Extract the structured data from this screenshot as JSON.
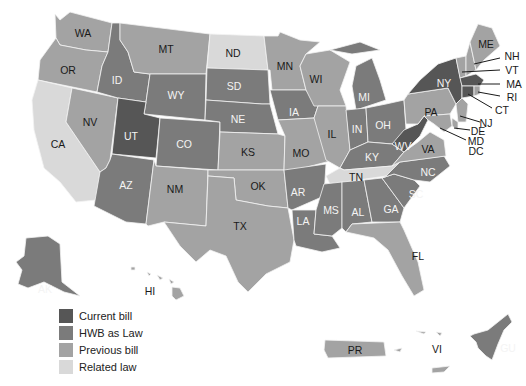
{
  "legend": {
    "items": [
      {
        "label": "Current bill",
        "color": "#565656"
      },
      {
        "label": "HWB as Law",
        "color": "#7b7b7b"
      },
      {
        "label": "Previous bill",
        "color": "#a3a3a3"
      },
      {
        "label": "Related law",
        "color": "#d9d9d9"
      }
    ]
  },
  "states": {
    "WA": "Previous bill",
    "OR": "Previous bill",
    "CA": "Related law",
    "NV": "Previous bill",
    "ID": "HWB as Law",
    "MT": "Previous bill",
    "WY": "HWB as Law",
    "UT": "Current bill",
    "AZ": "HWB as Law",
    "CO": "HWB as Law",
    "NM": "Previous bill",
    "ND": "Related law",
    "SD": "HWB as Law",
    "NE": "HWB as Law",
    "KS": "Previous bill",
    "OK": "Previous bill",
    "TX": "Previous bill",
    "MN": "Previous bill",
    "IA": "HWB as Law",
    "MO": "Previous bill",
    "AR": "HWB as Law",
    "LA": "HWB as Law",
    "WI": "Previous bill",
    "IL": "Previous bill",
    "MI": "HWB as Law",
    "IN": "HWB as Law",
    "OH": "HWB as Law",
    "KY": "HWB as Law",
    "TN": "Related law",
    "MS": "HWB as Law",
    "AL": "HWB as Law",
    "GA": "HWB as Law",
    "FL": "Previous bill",
    "SC": "HWB as Law",
    "NC": "HWB as Law",
    "VA": "Previous bill",
    "WV": "Current bill",
    "PA": "Previous bill",
    "NY": "Current bill",
    "ME": "Previous bill",
    "NH": "Previous bill",
    "VT": "Previous bill",
    "MA": "Current bill",
    "RI": "Previous bill",
    "CT": "Current bill",
    "NJ": "Previous bill",
    "DE": "Previous bill",
    "MD": "Previous bill",
    "DC": "Previous bill",
    "AK": "HWB as Law",
    "HI": "Previous bill",
    "PR": "Previous bill",
    "VI": "Previous bill",
    "GU": "HWB as Law"
  },
  "labels": {
    "WA": "WA",
    "OR": "OR",
    "CA": "CA",
    "NV": "NV",
    "ID": "ID",
    "MT": "MT",
    "WY": "WY",
    "UT": "UT",
    "AZ": "AZ",
    "CO": "CO",
    "NM": "NM",
    "ND": "ND",
    "SD": "SD",
    "NE": "NE",
    "KS": "KS",
    "OK": "OK",
    "TX": "TX",
    "MN": "MN",
    "IA": "IA",
    "MO": "MO",
    "AR": "AR",
    "LA": "LA",
    "WI": "WI",
    "IL": "IL",
    "MI": "MI",
    "IN": "IN",
    "OH": "OH",
    "KY": "KY",
    "TN": "TN",
    "MS": "MS",
    "AL": "AL",
    "GA": "GA",
    "FL": "FL",
    "SC": "SC",
    "NC": "NC",
    "VA": "VA",
    "WV": "WV",
    "PA": "PA",
    "NY": "NY",
    "ME": "ME",
    "NH": "NH",
    "VT": "VT",
    "MA": "MA",
    "RI": "RI",
    "CT": "CT",
    "NJ": "NJ",
    "DE": "DE",
    "MD": "MD",
    "DC": "DC",
    "AK": "AK",
    "HI": "HI",
    "PR": "PR",
    "VI": "VI",
    "GU": "GU"
  }
}
